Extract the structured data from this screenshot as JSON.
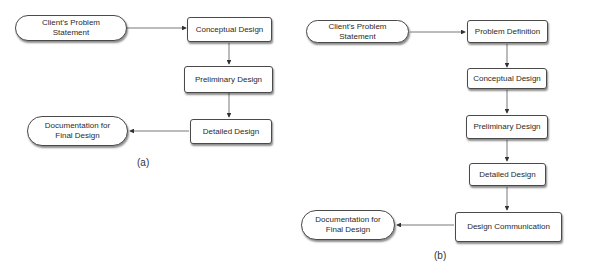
{
  "diagrams": [
    {
      "caption": "(a)",
      "nodes": {
        "start": {
          "label_line1": "Client's Problem",
          "label_line2": "Statement",
          "shape": "pill"
        },
        "conceptual": {
          "label": "Conceptual Design",
          "shape": "rect"
        },
        "preliminary": {
          "label": "Preliminary Design",
          "shape": "rect"
        },
        "detailed": {
          "label": "Detailed Design",
          "shape": "rect"
        },
        "end": {
          "label_line1": "Documentation for",
          "label_line2": "Final Design",
          "shape": "pill"
        }
      },
      "edges": [
        [
          "start",
          "conceptual"
        ],
        [
          "conceptual",
          "preliminary"
        ],
        [
          "preliminary",
          "detailed"
        ],
        [
          "detailed",
          "end"
        ]
      ]
    },
    {
      "caption": "(b)",
      "nodes": {
        "start": {
          "label_line1": "Client's Problem",
          "label_line2": "Statement",
          "shape": "pill"
        },
        "problem_definition": {
          "label": "Problem Definition",
          "shape": "rect"
        },
        "conceptual": {
          "label": "Conceptual Design",
          "shape": "rect"
        },
        "preliminary": {
          "label": "Preliminary Design",
          "shape": "rect"
        },
        "detailed": {
          "label": "Detailed Design",
          "shape": "rect"
        },
        "communication": {
          "label": "Design Communication",
          "shape": "rect"
        },
        "end": {
          "label_line1": "Documentation for",
          "label_line2": "Final Design",
          "shape": "pill"
        }
      },
      "edges": [
        [
          "start",
          "problem_definition"
        ],
        [
          "problem_definition",
          "conceptual"
        ],
        [
          "conceptual",
          "preliminary"
        ],
        [
          "preliminary",
          "detailed"
        ],
        [
          "detailed",
          "communication"
        ],
        [
          "communication",
          "end"
        ]
      ]
    }
  ],
  "colors": {
    "stroke": "#4a4a4a",
    "fill": "#ffffff",
    "text": "#2a2a2a"
  }
}
